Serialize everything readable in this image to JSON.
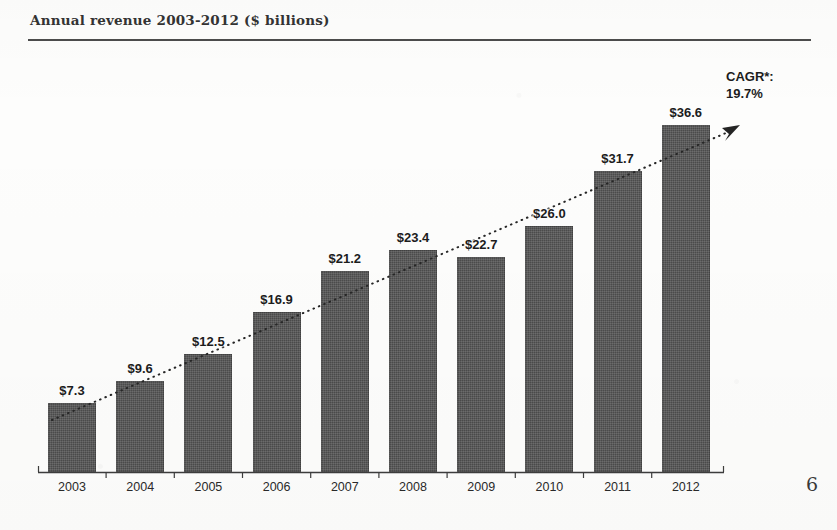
{
  "slide": {
    "title": "Annual revenue 2003-2012 ($ billions)",
    "page_number": "6"
  },
  "annotation": {
    "cagr_label": "CAGR*:",
    "cagr_value": "19.7%"
  },
  "colors": {
    "bar": "#4b4b4b",
    "text": "#1c1c1c",
    "rule": "#4c4c4c",
    "background": "#fdfdfc"
  },
  "chart_data": {
    "type": "bar",
    "title": "Annual revenue 2003-2012 ($ billions)",
    "xlabel": "",
    "ylabel": "",
    "ylim": [
      0,
      38
    ],
    "grid": false,
    "legend": "none",
    "axis": "category axis only, no value axis or gridlines",
    "categories": [
      "2003",
      "2004",
      "2005",
      "2006",
      "2007",
      "2008",
      "2009",
      "2010",
      "2011",
      "2012"
    ],
    "values": [
      7.3,
      9.6,
      12.5,
      16.9,
      21.2,
      23.4,
      22.7,
      26.0,
      31.7,
      36.6
    ],
    "data_labels": [
      "$7.3",
      "$9.6",
      "$12.5",
      "$16.9",
      "$21.2",
      "$23.4",
      "$22.7",
      "$26.0",
      "$31.7",
      "$36.6"
    ],
    "units": "$ billions",
    "annotations": [
      {
        "type": "trendline",
        "style": "dotted with arrowhead",
        "label": "CAGR*: 19.7%",
        "value": 19.7,
        "value_units": "percent"
      }
    ]
  }
}
